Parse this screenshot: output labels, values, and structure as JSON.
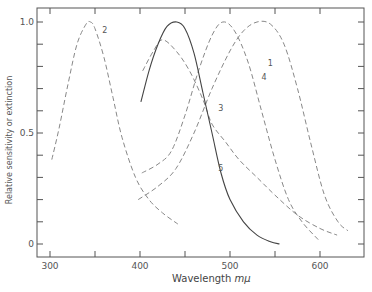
{
  "chart_data": {
    "type": "line",
    "title": "",
    "xlabel": "Wavelength",
    "xlabel_unit": "mμ",
    "ylabel": "Relative sensitivity or extinction",
    "xlim": [
      285,
      640
    ],
    "ylim": [
      -0.05,
      1.06
    ],
    "x_ticks": [
      300,
      400,
      500,
      600
    ],
    "x_minor_ticks": [
      350,
      450,
      550
    ],
    "y_ticks": [
      0,
      0.5,
      1.0
    ],
    "y_tick_labels": [
      "0",
      "0.5",
      "1.0"
    ],
    "y_minor_step": 0.1,
    "grid": false,
    "legend": "inline numeric labels on curves",
    "series": [
      {
        "name": "1",
        "style": "dashed",
        "points": [
          [
            398,
            0.2
          ],
          [
            420,
            0.26
          ],
          [
            440,
            0.34
          ],
          [
            460,
            0.5
          ],
          [
            480,
            0.7
          ],
          [
            500,
            0.87
          ],
          [
            515,
            0.96
          ],
          [
            530,
            1.0
          ],
          [
            545,
            0.99
          ],
          [
            560,
            0.9
          ],
          [
            575,
            0.7
          ],
          [
            590,
            0.45
          ],
          [
            605,
            0.22
          ],
          [
            620,
            0.1
          ],
          [
            631,
            0.06
          ]
        ]
      },
      {
        "name": "2",
        "style": "dashed",
        "points": [
          [
            302,
            0.38
          ],
          [
            310,
            0.52
          ],
          [
            320,
            0.72
          ],
          [
            330,
            0.9
          ],
          [
            340,
            0.99
          ],
          [
            345,
            1.0
          ],
          [
            350,
            0.97
          ],
          [
            360,
            0.84
          ],
          [
            370,
            0.66
          ],
          [
            380,
            0.48
          ],
          [
            395,
            0.3
          ],
          [
            410,
            0.2
          ],
          [
            425,
            0.14
          ],
          [
            442,
            0.09
          ]
        ]
      },
      {
        "name": "3",
        "style": "dashed",
        "points": [
          [
            403,
            0.78
          ],
          [
            415,
            0.87
          ],
          [
            425,
            0.92
          ],
          [
            440,
            0.87
          ],
          [
            455,
            0.78
          ],
          [
            470,
            0.65
          ],
          [
            480,
            0.54
          ],
          [
            495,
            0.46
          ],
          [
            510,
            0.38
          ],
          [
            530,
            0.3
          ],
          [
            550,
            0.22
          ],
          [
            575,
            0.13
          ],
          [
            600,
            0.07
          ],
          [
            619,
            0.04
          ]
        ]
      },
      {
        "name": "4",
        "style": "dashed",
        "points": [
          [
            402,
            0.32
          ],
          [
            420,
            0.36
          ],
          [
            435,
            0.42
          ],
          [
            450,
            0.58
          ],
          [
            465,
            0.78
          ],
          [
            480,
            0.94
          ],
          [
            492,
            1.0
          ],
          [
            505,
            0.96
          ],
          [
            520,
            0.82
          ],
          [
            535,
            0.6
          ],
          [
            550,
            0.38
          ],
          [
            565,
            0.2
          ],
          [
            580,
            0.1
          ],
          [
            598,
            0.02
          ]
        ]
      },
      {
        "name": "5",
        "style": "solid",
        "points": [
          [
            401,
            0.64
          ],
          [
            410,
            0.78
          ],
          [
            420,
            0.9
          ],
          [
            430,
            0.98
          ],
          [
            441,
            1.0
          ],
          [
            450,
            0.97
          ],
          [
            460,
            0.86
          ],
          [
            470,
            0.68
          ],
          [
            480,
            0.5
          ],
          [
            490,
            0.32
          ],
          [
            500,
            0.2
          ],
          [
            515,
            0.1
          ],
          [
            530,
            0.04
          ],
          [
            545,
            0.01
          ],
          [
            555,
            0.0
          ]
        ]
      }
    ],
    "annotations": [
      {
        "text": "1",
        "x": 542,
        "y": 0.8
      },
      {
        "text": "2",
        "x": 358,
        "y": 0.95
      },
      {
        "text": "3",
        "x": 487,
        "y": 0.6
      },
      {
        "text": "4",
        "x": 535,
        "y": 0.74
      },
      {
        "text": "5",
        "x": 487,
        "y": 0.33
      }
    ]
  }
}
